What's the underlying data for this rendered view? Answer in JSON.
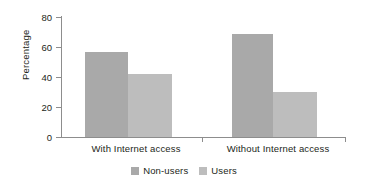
{
  "chart_data": {
    "type": "bar",
    "title": "",
    "subtitle": "",
    "xlabel": "",
    "ylabel": "Percentage",
    "categories": [
      "With Internet access",
      "Without Internet access"
    ],
    "series": [
      {
        "name": "Non-users",
        "values": [
          57,
          69
        ],
        "color": "#a9a9a9"
      },
      {
        "name": "Users",
        "values": [
          42,
          30
        ],
        "color": "#bdbdbd"
      }
    ],
    "ylim": [
      0,
      80
    ],
    "yticks": [
      0,
      20,
      40,
      60,
      80
    ],
    "ytick_labels": [
      "0",
      "20",
      "40",
      "60",
      "80"
    ],
    "grid": false,
    "legend_position": "bottom-center",
    "bar_gap_within_group": 0,
    "axis_color": "#8d8d8d",
    "text_color": "#231f20",
    "background": "#ffffff"
  },
  "axis": {
    "y_title": "Percentage",
    "ticks": [
      {
        "label": "80",
        "value": 80
      },
      {
        "label": "60",
        "value": 60
      },
      {
        "label": "40",
        "value": 40
      },
      {
        "label": "20",
        "value": 20
      },
      {
        "label": "0",
        "value": 0
      }
    ]
  },
  "groups": [
    {
      "label": "With Internet access",
      "bars": [
        {
          "series": "Non-users",
          "value": 57,
          "color": "#a9a9a9"
        },
        {
          "series": "Users",
          "value": 42,
          "color": "#bdbdbd"
        }
      ]
    },
    {
      "label": "Without Internet access",
      "bars": [
        {
          "series": "Non-users",
          "value": 69,
          "color": "#a9a9a9"
        },
        {
          "series": "Users",
          "value": 30,
          "color": "#bdbdbd"
        }
      ]
    }
  ],
  "legend": {
    "items": [
      {
        "label": "Non-users",
        "color": "#a9a9a9"
      },
      {
        "label": "Users",
        "color": "#bdbdbd"
      }
    ]
  }
}
